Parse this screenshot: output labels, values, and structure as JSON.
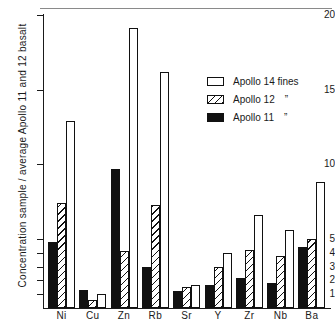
{
  "chart_data": {
    "type": "bar",
    "title": "",
    "xlabel": "",
    "ylabel": "Concentration sample / average Apollo 11 and 12 basalt",
    "ylim": [
      0,
      20
    ],
    "ytick_labels": [
      "20",
      "15",
      "10",
      "5",
      "4",
      "3",
      "2",
      "1"
    ],
    "ytick_values": [
      20,
      15,
      10,
      5,
      4,
      3,
      2,
      1
    ],
    "axis_note": "linear from 5 to 20; compressed unit ticks below 5",
    "grid": false,
    "legend_position": "upper right",
    "categories": [
      "Ni",
      "Cu",
      "Zn",
      "Rb",
      "Sr",
      "Y",
      "Zr",
      "Nb",
      "Ba"
    ],
    "series": [
      {
        "name": "Apollo 14 fines",
        "fill": "white",
        "values": [
          12.9,
          1.0,
          19.1,
          16.2,
          1.7,
          4.0,
          6.6,
          5.6,
          8.8
        ]
      },
      {
        "name": "Apollo 12",
        "fill": "hatched",
        "values": [
          7.4,
          0.6,
          4.1,
          7.3,
          1.5,
          3.0,
          4.2,
          3.8,
          5.0
        ]
      },
      {
        "name": "Apollo 11",
        "fill": "black",
        "values": [
          4.8,
          1.3,
          9.7,
          3.0,
          1.2,
          1.7,
          2.2,
          1.8,
          4.4
        ]
      }
    ]
  },
  "legend": {
    "items": [
      {
        "label": "Apollo 14 fines",
        "ditto": "",
        "fill": "white"
      },
      {
        "label": "Apollo 12",
        "ditto": "”",
        "fill": "hatched"
      },
      {
        "label": "Apollo 11",
        "ditto": "”",
        "fill": "black"
      }
    ]
  },
  "axis": {
    "y_title": "Concentration sample / average Apollo 11 and 12 basalt"
  }
}
